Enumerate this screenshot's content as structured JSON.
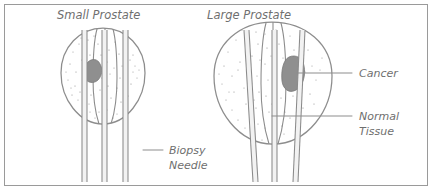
{
  "figure": {
    "title_small": "Small Prostate",
    "title_large": "Large Prostate",
    "labels": {
      "cancer": "Cancer",
      "normal_tissue_line1": "Normal",
      "normal_tissue_line2": "Tissue",
      "biopsy_line1": "Biopsy",
      "biopsy_line2": "Needle"
    },
    "colors": {
      "frame": "#9a9a9a",
      "outline": "#8d8d8d",
      "tumor": "#8f8f8f",
      "text": "#6f6f6f",
      "needle": "#8a8a8a",
      "background": "#ffffff"
    },
    "counts": {
      "needles_small_prostate": 3,
      "needles_large_prostate": 3,
      "tumors": 2
    }
  }
}
